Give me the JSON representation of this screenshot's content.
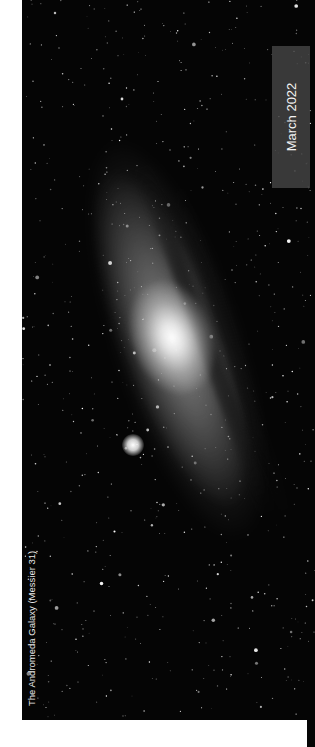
{
  "photo": {
    "subject": "andromeda-galaxy",
    "caption": "The Andromeda Galaxy (Messier 31)"
  },
  "label": {
    "date": "March 2022"
  },
  "colors": {
    "background": "#ffffff",
    "sky": "#050505",
    "label_box": "#464646",
    "label_text": "#f2f2f2"
  }
}
